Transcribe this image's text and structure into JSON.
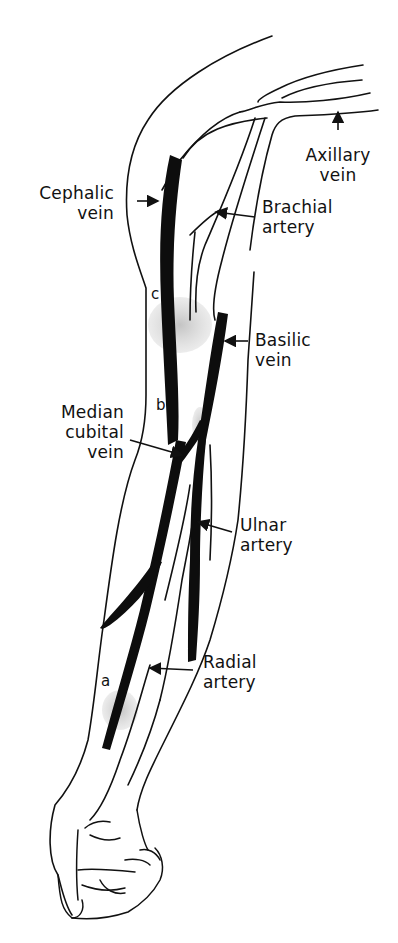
{
  "figure": {
    "labels": [
      {
        "id": "axillary_vein",
        "line1": "Axillary",
        "line2": "vein"
      },
      {
        "id": "cephalic_vein",
        "line1": "Cephalic",
        "line2": "vein"
      },
      {
        "id": "brachial_artery",
        "line1": "Brachial",
        "line2": "artery"
      },
      {
        "id": "basilic_vein",
        "line1": "Basilic",
        "line2": "vein"
      },
      {
        "id": "median_cubital_vein",
        "line1": "Median",
        "line2": "cubital",
        "line3": "vein"
      },
      {
        "id": "ulnar_artery",
        "line1": "Ulnar",
        "line2": "artery"
      },
      {
        "id": "radial_artery",
        "line1": "Radial",
        "line2": "artery"
      }
    ],
    "site_markers": [
      "c",
      "b",
      "a"
    ],
    "colors": {
      "ink": "#111111",
      "vein_fill": "#0d0d0d",
      "shading": "#c8c8c8",
      "background": "#ffffff"
    }
  }
}
